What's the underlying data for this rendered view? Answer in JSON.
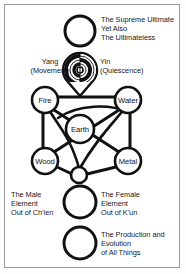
{
  "figure": {
    "border_color": "#9a9a9a",
    "background_color": "#ffffff",
    "ink_color": "#111111"
  },
  "captions": {
    "supreme_ultimate": "The Supreme Ultimate\nYet Also\nThe Ultimateless",
    "yang": "Yang\n(Movement)",
    "yin": "Yin\n(Quiescence)",
    "male_element": "The Male\nElement\nOut of Ch'ien",
    "female_element": "The Female\nElement\nOut of K'un",
    "production": "The Production and\nEvolution\nof All Things"
  },
  "nodes": {
    "fire": "Fire",
    "water": "Water",
    "earth": "Earth",
    "wood": "Wood",
    "metal": "Metal"
  },
  "circles": {
    "supreme_ultimate": {
      "cx": 80,
      "cy": 31,
      "r": 15
    },
    "taiji_rings": {
      "cx": 80,
      "cy": 70,
      "r": 17
    },
    "union_small": {
      "cx": 79,
      "cy": 175,
      "r": 8
    },
    "male_female": {
      "cx": 80,
      "cy": 202,
      "r": 16
    },
    "production": {
      "cx": 80,
      "cy": 243,
      "r": 16
    }
  },
  "five_phases": {
    "fire": {
      "cx": 45,
      "cy": 100,
      "r": 13
    },
    "water": {
      "cx": 128,
      "cy": 100,
      "r": 13
    },
    "earth": {
      "cx": 80,
      "cy": 129,
      "r": 14
    },
    "wood": {
      "cx": 45,
      "cy": 161,
      "r": 13
    },
    "metal": {
      "cx": 128,
      "cy": 161,
      "r": 13
    }
  }
}
